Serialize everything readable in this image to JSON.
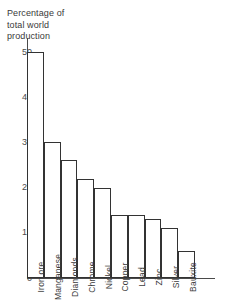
{
  "chart_data": {
    "type": "bar",
    "title": "Percentage of\ntotal world\nproduction",
    "title_lines": [
      "Percentage of",
      "total world",
      "production"
    ],
    "xlabel": "",
    "ylabel": "",
    "ylim": [
      0,
      50
    ],
    "yticks": [
      0,
      10,
      20,
      30,
      40,
      50
    ],
    "ytick_labels": [
      "0",
      "10",
      "20",
      "30",
      "40",
      "50"
    ],
    "grid": false,
    "legend": false,
    "orientation": "vertical",
    "bar_style": "outline",
    "categories": [
      "Iron ore",
      "Manganese",
      "Diamonds",
      "Chrome",
      "Nickel",
      "Copper",
      "Lead",
      "Zinc",
      "Silver",
      "Bauxite"
    ],
    "values": [
      50,
      30,
      26,
      22,
      20,
      14,
      14,
      13,
      11,
      6
    ],
    "series": [
      {
        "name": "Percentage of total world production",
        "values": [
          50,
          30,
          26,
          22,
          20,
          14,
          14,
          13,
          11,
          6
        ]
      }
    ],
    "bars": [
      {
        "label": "Iron ore",
        "value": 50
      },
      {
        "label": "Manganese",
        "value": 30
      },
      {
        "label": "Diamonds",
        "value": 26
      },
      {
        "label": "Chrome",
        "value": 22
      },
      {
        "label": "Nickel",
        "value": 20
      },
      {
        "label": "Copper",
        "value": 14
      },
      {
        "label": "Lead",
        "value": 14
      },
      {
        "label": "Zinc",
        "value": 13
      },
      {
        "label": "Silver",
        "value": 11
      },
      {
        "label": "Bauxite",
        "value": 6
      }
    ],
    "colors": {
      "bar_fill": "#ffffff",
      "bar_stroke": "#333333",
      "axis": "#4a4a4a",
      "text": "#3a3a3a",
      "background": "#ffffff"
    }
  }
}
